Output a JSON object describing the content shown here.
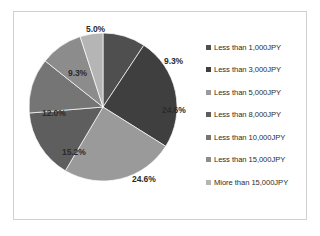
{
  "chart_data": {
    "type": "pie",
    "title": "",
    "categories": [
      "Less than 1,000JPY",
      "Less than 3,000JPY",
      "Less than 5,000JPY",
      "Less than 8,000JPY",
      "Less than 10,000JPY",
      "Less than 15,000JPY",
      "Miore than 15,000JPY"
    ],
    "values": [
      9.3,
      24.6,
      24.6,
      15.2,
      12.0,
      9.3,
      5.0
    ],
    "value_labels": [
      "9.3%",
      "24.6%",
      "24.6%",
      "15.2%",
      "12.0%",
      "9.3%",
      "5.0%"
    ],
    "unit": "%",
    "start_angle_deg": 0,
    "direction": "clockwise",
    "colors": [
      "#4f4f4f",
      "#3f3f3f",
      "#9a9a9a",
      "#5e5e5e",
      "#757575",
      "#8c8c8c",
      "#b5b5b5"
    ],
    "legend_position": "right",
    "grid": false,
    "xlabel": "",
    "ylabel": ""
  },
  "slice_labels": [
    {
      "text": "9.3%",
      "left": 150,
      "top": 44
    },
    {
      "text": "24.6%",
      "left": 148,
      "top": 93
    },
    {
      "text": "24.6%",
      "left": 118,
      "top": 162
    },
    {
      "text": "15.2%",
      "left": 48,
      "top": 135
    },
    {
      "text": "12.0%",
      "left": 28,
      "top": 96
    },
    {
      "text": "9.3%",
      "left": 54,
      "top": 56
    },
    {
      "text": "5.0%",
      "left": 72,
      "top": 12
    }
  ],
  "legend": {
    "items": [
      {
        "label": "Less than 1,000JPY",
        "color": "#4f4f4f"
      },
      {
        "label": "Less than 3,000JPY",
        "color": "#3f3f3f"
      },
      {
        "label": "Less than 5,000JPY",
        "color": "#9a9a9a"
      },
      {
        "label": "Less than 8,000JPY",
        "color": "#5e5e5e"
      },
      {
        "label": "Less than 10,000JPY",
        "color": "#757575"
      },
      {
        "label": "Less than 15,000JPY",
        "color": "#8c8c8c"
      },
      {
        "label": "Miore than 15,000JPY",
        "color": "#b5b5b5"
      }
    ]
  }
}
